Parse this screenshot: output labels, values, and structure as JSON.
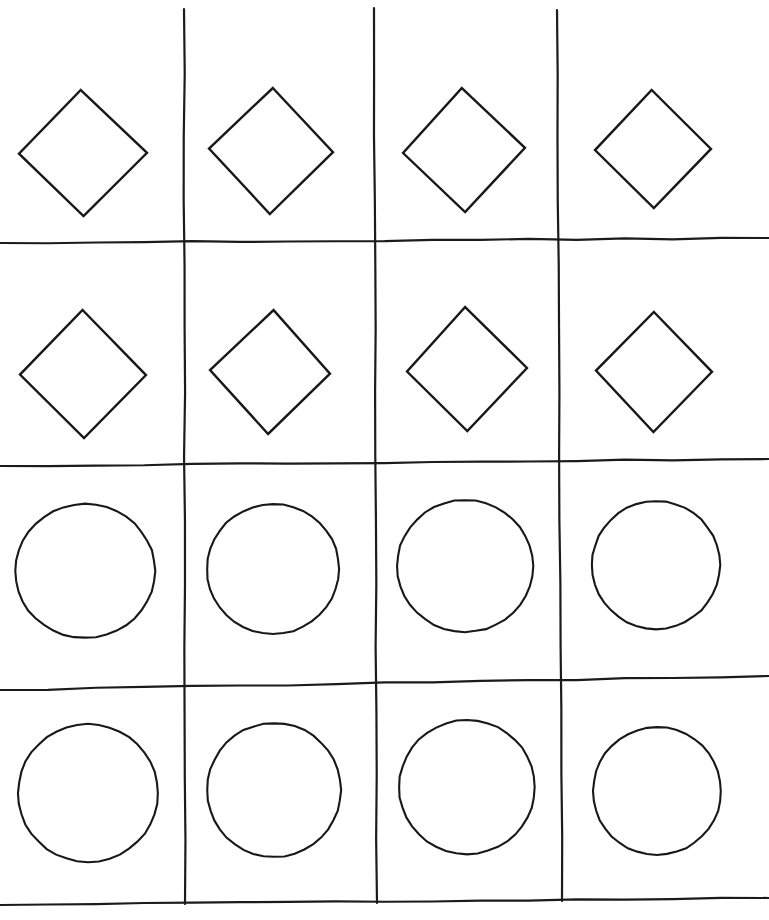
{
  "page": {
    "background_color": "#ffffff",
    "ink_color": "#1b1b1b",
    "width": 769,
    "height": 920
  },
  "grid": {
    "rows": 4,
    "columns": 4,
    "line_color": "#1b1b1b",
    "line_width": 2.2,
    "style": "hand-drawn",
    "vertical_lines": [
      {
        "name": "vline-1",
        "x_top": 184,
        "y_top": 9,
        "x_bottom": 185,
        "y_bottom": 904
      },
      {
        "name": "vline-2",
        "x_top": 374,
        "y_top": 8,
        "x_bottom": 377,
        "y_bottom": 903
      },
      {
        "name": "vline-3",
        "x_top": 557,
        "y_top": 10,
        "x_bottom": 562,
        "y_bottom": 901
      }
    ],
    "horizontal_lines": [
      {
        "name": "hline-1",
        "x_left": 0,
        "y_left": 243,
        "x_right": 769,
        "y_right": 238
      },
      {
        "name": "hline-2",
        "x_left": 0,
        "y_left": 466,
        "x_right": 769,
        "y_right": 459
      },
      {
        "name": "hline-3",
        "x_left": 0,
        "y_left": 690,
        "x_right": 769,
        "y_right": 676
      },
      {
        "name": "hline-4",
        "x_left": 0,
        "y_left": 905,
        "x_right": 769,
        "y_right": 898
      }
    ]
  },
  "cells": [
    {
      "row": 1,
      "col": 1,
      "shape": "diamond",
      "cx": 83,
      "cy": 153,
      "rx": 64,
      "ry": 63,
      "rotation": -1
    },
    {
      "row": 1,
      "col": 1,
      "id": "r1c1"
    },
    {
      "row": 1,
      "col": 2,
      "shape": "diamond",
      "cx": 271,
      "cy": 151,
      "rx": 62,
      "ry": 63,
      "rotation": 1
    },
    {
      "row": 1,
      "col": 3,
      "shape": "diamond",
      "cx": 464,
      "cy": 150,
      "rx": 61,
      "ry": 62,
      "rotation": -2
    },
    {
      "row": 1,
      "col": 4,
      "shape": "diamond",
      "cx": 653,
      "cy": 149,
      "rx": 58,
      "ry": 59,
      "rotation": 0
    },
    {
      "row": 2,
      "col": 1,
      "shape": "diamond",
      "cx": 83,
      "cy": 374,
      "rx": 63,
      "ry": 64,
      "rotation": 0
    },
    {
      "row": 2,
      "col": 2,
      "shape": "diamond",
      "cx": 270,
      "cy": 372,
      "rx": 60,
      "ry": 62,
      "rotation": 2
    },
    {
      "row": 2,
      "col": 3,
      "shape": "diamond",
      "cx": 467,
      "cy": 369,
      "rx": 60,
      "ry": 62,
      "rotation": -1
    },
    {
      "row": 2,
      "col": 4,
      "shape": "diamond",
      "cx": 654,
      "cy": 372,
      "rx": 58,
      "ry": 60,
      "rotation": 0
    },
    {
      "row": 3,
      "col": 1,
      "shape": "circle",
      "cx": 85,
      "cy": 571,
      "rx": 70,
      "ry": 67,
      "rotation": 0
    },
    {
      "row": 3,
      "col": 2,
      "shape": "circle",
      "cx": 273,
      "cy": 569,
      "rx": 66,
      "ry": 65,
      "rotation": 0
    },
    {
      "row": 3,
      "col": 3,
      "shape": "circle",
      "cx": 465,
      "cy": 566,
      "rx": 68,
      "ry": 66,
      "rotation": 0
    },
    {
      "row": 3,
      "col": 4,
      "shape": "circle",
      "cx": 656,
      "cy": 565,
      "rx": 64,
      "ry": 64,
      "rotation": 0
    },
    {
      "row": 4,
      "col": 1,
      "shape": "circle",
      "cx": 88,
      "cy": 793,
      "rx": 70,
      "ry": 69,
      "rotation": 0
    },
    {
      "row": 4,
      "col": 2,
      "shape": "circle",
      "cx": 274,
      "cy": 790,
      "rx": 67,
      "ry": 67,
      "rotation": 0
    },
    {
      "row": 4,
      "col": 3,
      "shape": "circle",
      "cx": 467,
      "cy": 787,
      "rx": 68,
      "ry": 67,
      "rotation": 0
    },
    {
      "row": 4,
      "col": 4,
      "shape": "circle",
      "cx": 657,
      "cy": 791,
      "rx": 64,
      "ry": 64,
      "rotation": 0
    }
  ],
  "legend": {
    "row_1_shape": "diamond",
    "row_2_shape": "diamond",
    "row_3_shape": "circle",
    "row_4_shape": "circle",
    "total_shapes": 16,
    "diamond_count": 8,
    "circle_count": 8
  }
}
